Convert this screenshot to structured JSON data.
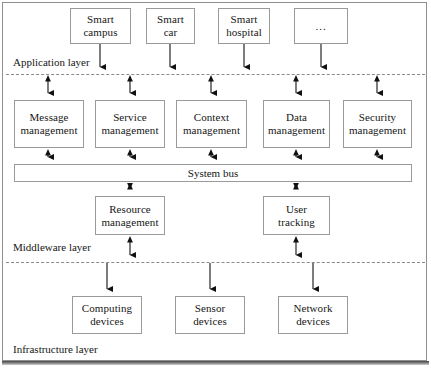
{
  "diagram": {
    "background": "#ffffff",
    "box_border_color": "#9a9a9a",
    "divider_color": "#8a8a8a",
    "arrow_color": "#111111"
  },
  "layers": [
    {
      "id": "application",
      "label": "Application layer",
      "nodes": [
        {
          "id": "smart-campus",
          "line1": "Smart",
          "line2": "campus",
          "x": 70,
          "y": 8,
          "w": 61,
          "h": 36
        },
        {
          "id": "smart-car",
          "line1": "Smart",
          "line2": "car",
          "x": 146,
          "y": 8,
          "w": 49,
          "h": 36
        },
        {
          "id": "smart-hospital",
          "line1": "Smart",
          "line2": "hospital",
          "x": 218,
          "y": 8,
          "w": 52,
          "h": 36
        },
        {
          "id": "more",
          "line1": "...",
          "line2": "",
          "x": 294,
          "y": 8,
          "w": 54,
          "h": 36
        }
      ]
    },
    {
      "id": "middleware",
      "label": "Middleware layer",
      "nodes": [
        {
          "id": "message-management",
          "line1": "Message",
          "line2": "management",
          "x": 14,
          "y": 100,
          "w": 70,
          "h": 48
        },
        {
          "id": "service-management",
          "line1": "Service",
          "line2": "management",
          "x": 95,
          "y": 100,
          "w": 70,
          "h": 48
        },
        {
          "id": "context-management",
          "line1": "Context",
          "line2": "management",
          "x": 176,
          "y": 100,
          "w": 71,
          "h": 48
        },
        {
          "id": "data-management",
          "line1": "Data",
          "line2": "management",
          "x": 263,
          "y": 100,
          "w": 67,
          "h": 48
        },
        {
          "id": "security-management",
          "line1": "Security",
          "line2": "management",
          "x": 343,
          "y": 100,
          "w": 69,
          "h": 48
        },
        {
          "id": "resource-management",
          "line1": "Resource",
          "line2": "management",
          "x": 95,
          "y": 196,
          "w": 70,
          "h": 39
        },
        {
          "id": "user-tracking",
          "line1": "User",
          "line2": "tracking",
          "x": 263,
          "y": 196,
          "w": 67,
          "h": 39
        }
      ],
      "bus": {
        "id": "system-bus",
        "label": "System bus",
        "x": 14,
        "y": 164,
        "w": 398,
        "h": 18
      }
    },
    {
      "id": "infrastructure",
      "label": "Infrastructure layer",
      "nodes": [
        {
          "id": "computing-devices",
          "line1": "Computing",
          "line2": "devices",
          "x": 72,
          "y": 296,
          "w": 70,
          "h": 38
        },
        {
          "id": "sensor-devices",
          "line1": "Sensor",
          "line2": "devices",
          "x": 175,
          "y": 296,
          "w": 70,
          "h": 38
        },
        {
          "id": "network-devices",
          "line1": "Network",
          "line2": "devices",
          "x": 278,
          "y": 296,
          "w": 70,
          "h": 38
        }
      ]
    }
  ],
  "labels": {
    "application_layer": {
      "text": "Application layer",
      "x": 13,
      "y": 56
    },
    "middleware_layer": {
      "text": "Middleware layer",
      "x": 13,
      "y": 241
    },
    "infrastructure_layer": {
      "text": "Infrastructure layer",
      "x": 13,
      "y": 343
    }
  },
  "dividers": [
    {
      "id": "application-middleware-divider",
      "x": 6,
      "y": 74,
      "w": 419
    },
    {
      "id": "middleware-infrastructure-divider",
      "x": 6,
      "y": 262,
      "w": 419
    }
  ],
  "connectors": [
    {
      "id": "smart-campus-to-divider",
      "x": 100,
      "y1": 44,
      "y2": 73,
      "heads": "down"
    },
    {
      "id": "smart-car-to-divider",
      "x": 170,
      "y1": 44,
      "y2": 73,
      "heads": "down"
    },
    {
      "id": "smart-hospital-to-divider",
      "x": 244,
      "y1": 44,
      "y2": 73,
      "heads": "down"
    },
    {
      "id": "more-to-divider",
      "x": 321,
      "y1": 44,
      "y2": 73,
      "heads": "down"
    },
    {
      "id": "divider-to-message",
      "x": 48,
      "y1": 75,
      "y2": 99,
      "heads": "both"
    },
    {
      "id": "divider-to-service",
      "x": 130,
      "y1": 75,
      "y2": 99,
      "heads": "both"
    },
    {
      "id": "divider-to-context",
      "x": 211,
      "y1": 75,
      "y2": 99,
      "heads": "both"
    },
    {
      "id": "divider-to-data",
      "x": 296,
      "y1": 75,
      "y2": 99,
      "heads": "both"
    },
    {
      "id": "divider-to-security",
      "x": 377,
      "y1": 75,
      "y2": 99,
      "heads": "both"
    },
    {
      "id": "message-to-bus",
      "x": 48,
      "y1": 149,
      "y2": 163,
      "heads": "both"
    },
    {
      "id": "service-to-bus",
      "x": 130,
      "y1": 149,
      "y2": 163,
      "heads": "both"
    },
    {
      "id": "context-to-bus",
      "x": 211,
      "y1": 149,
      "y2": 163,
      "heads": "both"
    },
    {
      "id": "data-to-bus",
      "x": 296,
      "y1": 149,
      "y2": 163,
      "heads": "both"
    },
    {
      "id": "security-to-bus",
      "x": 377,
      "y1": 149,
      "y2": 163,
      "heads": "both"
    },
    {
      "id": "bus-to-resource",
      "x": 130,
      "y1": 183,
      "y2": 195,
      "heads": "both"
    },
    {
      "id": "bus-to-user-tracking",
      "x": 296,
      "y1": 183,
      "y2": 195,
      "heads": "both"
    },
    {
      "id": "resource-to-divider",
      "x": 130,
      "y1": 236,
      "y2": 261,
      "heads": "both"
    },
    {
      "id": "user-tracking-to-divider",
      "x": 296,
      "y1": 236,
      "y2": 261,
      "heads": "both"
    },
    {
      "id": "divider-to-computing",
      "x": 107,
      "y1": 263,
      "y2": 295,
      "heads": "down"
    },
    {
      "id": "divider-to-sensor",
      "x": 210,
      "y1": 263,
      "y2": 295,
      "heads": "down"
    },
    {
      "id": "divider-to-network",
      "x": 313,
      "y1": 263,
      "y2": 295,
      "heads": "down"
    }
  ]
}
